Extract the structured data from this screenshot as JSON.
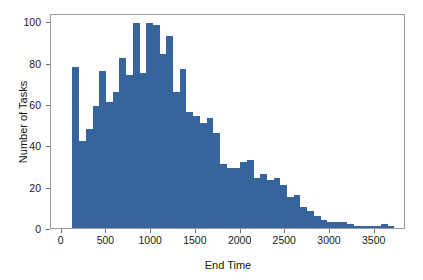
{
  "chart_data": {
    "type": "bar",
    "title": "",
    "subtitle": "",
    "xlabel": "End Time",
    "ylabel": "Number of Tasks",
    "xlim": [
      -120,
      3850
    ],
    "ylim": [
      0,
      104
    ],
    "xticks": [
      0,
      500,
      1000,
      1500,
      2000,
      2500,
      3000,
      3500
    ],
    "xtick_labels": [
      "0",
      "500",
      "1000",
      "1500",
      "2000",
      "2500",
      "3000",
      "3500"
    ],
    "yticks": [
      0,
      20,
      40,
      60,
      80,
      100
    ],
    "ytick_labels": [
      "0",
      "20",
      "40",
      "60",
      "80",
      "100"
    ],
    "grid": false,
    "legend": null,
    "bin_width": 75,
    "bar_color": "#35659C",
    "frame_color": "#9a9a9a",
    "bin_starts": [
      120,
      195,
      270,
      345,
      420,
      495,
      570,
      645,
      720,
      795,
      870,
      945,
      1020,
      1095,
      1170,
      1245,
      1320,
      1395,
      1470,
      1545,
      1620,
      1695,
      1770,
      1845,
      1920,
      1995,
      2070,
      2145,
      2220,
      2295,
      2370,
      2445,
      2520,
      2595,
      2670,
      2745,
      2820,
      2895,
      2970,
      3045,
      3120,
      3195,
      3270,
      3345,
      3420,
      3495,
      3570,
      3645
    ],
    "values": [
      78,
      42,
      48,
      59,
      76,
      61,
      66,
      82,
      74,
      99,
      75,
      99,
      98,
      84,
      93,
      66,
      77,
      56,
      54,
      51,
      53,
      46,
      31,
      29,
      29,
      32,
      33,
      24,
      26,
      23,
      24,
      21,
      15,
      16,
      10,
      8,
      6,
      4,
      3,
      3,
      3,
      2,
      1,
      1,
      1,
      1,
      2,
      1
    ],
    "annotations": []
  },
  "axes": {
    "ylabel": "Number of Tasks",
    "xlabel": "End Time"
  }
}
